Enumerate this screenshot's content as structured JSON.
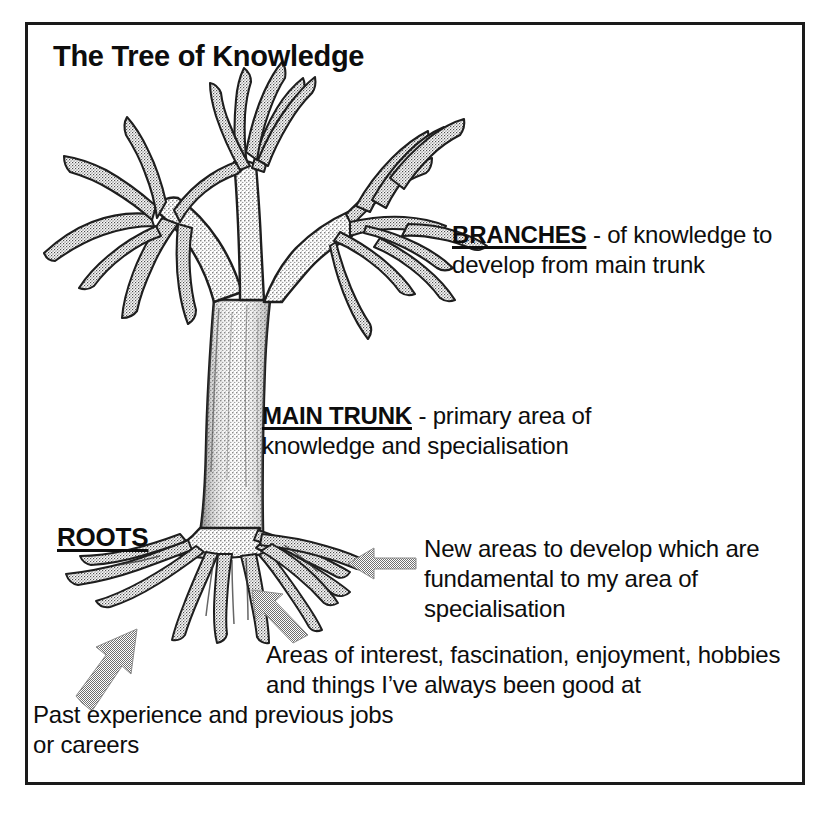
{
  "document": {
    "title": "The Tree of Knowledge",
    "frame_color": "#1a1a1a",
    "background_color": "#ffffff",
    "text_color": "#0d0d0d",
    "arrow_color": "#8c8c8c",
    "tree_ink_color": "#2b2b2b"
  },
  "annotations": {
    "branches": {
      "lead": "BRANCHES",
      "body": " - of knowledge to develop from main trunk"
    },
    "main_trunk": {
      "lead": "MAIN TRUNK",
      "body": " - primary area of knowledge and specialisation"
    },
    "roots": {
      "lead": "ROOTS"
    },
    "new_areas": {
      "body": "New areas to develop which are fundamental to my area of specialisation"
    },
    "interest": {
      "body": "Areas of interest, fascination, enjoyment, hobbies and things I’ve always been good at"
    },
    "past_experience": {
      "body": "Past experience and previous jobs or careers"
    }
  },
  "diagram": {
    "type": "tree-metaphor-diagram",
    "subject": "tree",
    "parts": [
      {
        "name": "branches",
        "meaning": "of knowledge to develop from main trunk"
      },
      {
        "name": "main trunk",
        "meaning": "primary area of knowledge and specialisation"
      },
      {
        "name": "roots",
        "meaning": "foundations: past experience, interests, new fundamental areas"
      }
    ],
    "arrows": [
      {
        "name": "arrow-to-lower-right-roots",
        "points_to": "roots",
        "label_ref": "new_areas",
        "direction": "left"
      },
      {
        "name": "arrow-to-center-roots",
        "points_to": "roots",
        "label_ref": "interest",
        "direction": "up-left"
      },
      {
        "name": "arrow-to-left-roots",
        "points_to": "roots",
        "label_ref": "past_experience",
        "direction": "up-right"
      }
    ]
  }
}
